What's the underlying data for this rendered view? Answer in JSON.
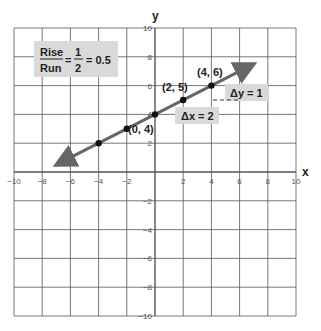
{
  "chart_data": {
    "type": "line",
    "title": "",
    "xlabel": "x",
    "ylabel": "y",
    "xlim": [
      -10,
      10
    ],
    "ylim": [
      -10,
      10
    ],
    "grid": true,
    "grid_step": 2,
    "x_ticks": [
      "-10",
      "-8",
      "-6",
      "-4",
      "-2",
      "2",
      "4",
      "6",
      "8",
      "10"
    ],
    "y_ticks": [
      "10",
      "8",
      "6",
      "4",
      "2",
      "-2",
      "-4",
      "-6",
      "-8",
      "-10"
    ],
    "series": [
      {
        "name": "line y = 0.5x + 4",
        "points": [
          [
            -4,
            2
          ],
          [
            -2,
            3
          ],
          [
            0,
            4
          ],
          [
            2,
            5
          ],
          [
            4,
            6
          ]
        ],
        "arrow_start": [
          -6.5,
          0.75
        ],
        "arrow_end": [
          6.5,
          7.25
        ],
        "color": "#666666"
      }
    ],
    "annotations": {
      "point_labels": [
        {
          "text": "(0, 4)",
          "x": 0,
          "y": 4
        },
        {
          "text": "(2, 5)",
          "x": 2,
          "y": 5
        },
        {
          "text": "(4, 6)",
          "x": 4,
          "y": 6
        }
      ],
      "delta_x": "Δx = 2",
      "delta_y": "Δy = 1",
      "slope_box": {
        "numerator_word": "Rise",
        "denominator_word": "Run",
        "numerator_num": "1",
        "denominator_num": "2",
        "result": "= 0.5"
      }
    }
  },
  "labels": {
    "x_axis": "x",
    "y_axis": "y",
    "p1": "(0, 4)",
    "p2": "(2, 5)",
    "p3": "(4, 6)",
    "dx": "Δx = 2",
    "dy": "Δy = 1",
    "rise": "Rise",
    "run": "Run",
    "eq1": "=",
    "one": "1",
    "two": "2",
    "result": "= 0.5"
  },
  "colors": {
    "grid": "#555555",
    "line": "#666666",
    "box": "#d9d9d9",
    "point": "#111111"
  }
}
